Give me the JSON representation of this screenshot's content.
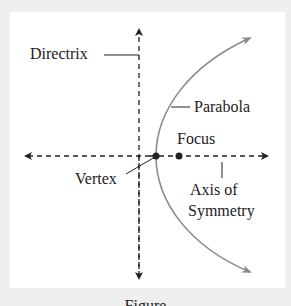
{
  "diagram": {
    "labels": {
      "directrix": "Directrix",
      "parabola": "Parabola",
      "focus": "Focus",
      "vertex": "Vertex",
      "axis_line1": "Axis of",
      "axis_line2": "Symmetry"
    },
    "caption": "Figure",
    "colors": {
      "background": "#efefef",
      "panel": "#ffffff",
      "lines": "#222222",
      "parabola": "#8a8a8a"
    }
  }
}
